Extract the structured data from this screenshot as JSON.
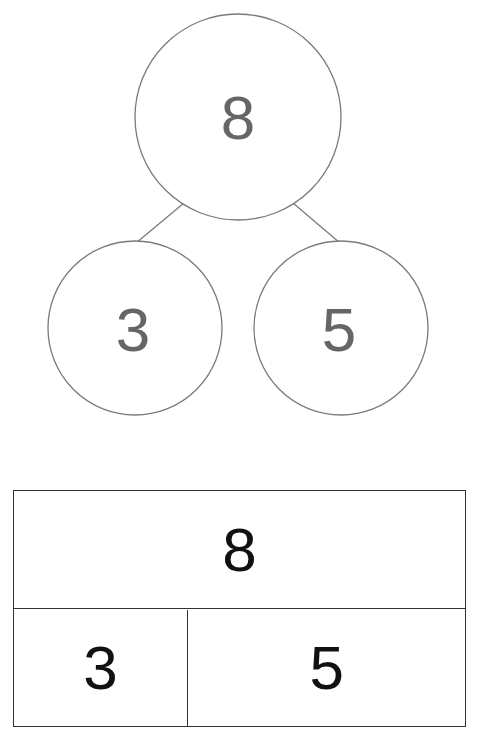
{
  "number_bond": {
    "whole": "8",
    "parts": [
      "3",
      "5"
    ],
    "colors": {
      "stroke": "#7a7a7a",
      "number": "#666666"
    }
  },
  "bar_model": {
    "whole": "8",
    "parts": [
      "3",
      "5"
    ],
    "colors": {
      "stroke": "#333333",
      "number": "#111111"
    }
  }
}
